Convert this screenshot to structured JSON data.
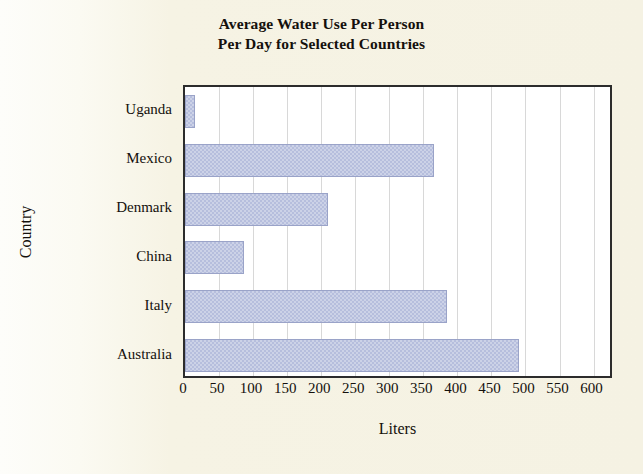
{
  "chart_data": {
    "type": "bar",
    "orientation": "horizontal",
    "title": "Average Water Use Per Person Per Day for Selected Countries",
    "title_line1": "Average Water Use Per Person",
    "title_line2": "Per Day for Selected Countries",
    "xlabel": "Liters",
    "ylabel": "Country",
    "categories": [
      "Australia",
      "Italy",
      "China",
      "Denmark",
      "Mexico",
      "Uganda"
    ],
    "values": [
      490,
      385,
      87,
      210,
      365,
      15
    ],
    "categories_top_to_bottom": [
      "Uganda",
      "Mexico",
      "Denmark",
      "China",
      "Italy",
      "Australia"
    ],
    "values_top_to_bottom": [
      15,
      365,
      210,
      87,
      385,
      490
    ],
    "xlim": [
      0,
      630
    ],
    "xticks": [
      0,
      50,
      100,
      150,
      200,
      250,
      300,
      350,
      400,
      450,
      500,
      550,
      600
    ],
    "xtick_labels": [
      "0",
      "50",
      "100",
      "150",
      "200",
      "250",
      "300",
      "350",
      "400",
      "450",
      "500",
      "550",
      "600"
    ],
    "grid": "vertical",
    "legend": "none",
    "bar_color": "#b6bedd",
    "bar_edge_color": "#9aa3c8",
    "plot_background": "#ffffff",
    "page_background": "#f6f3e4",
    "axis_color": "#2c2c2c",
    "gridline_color": "#d8d8d8"
  }
}
